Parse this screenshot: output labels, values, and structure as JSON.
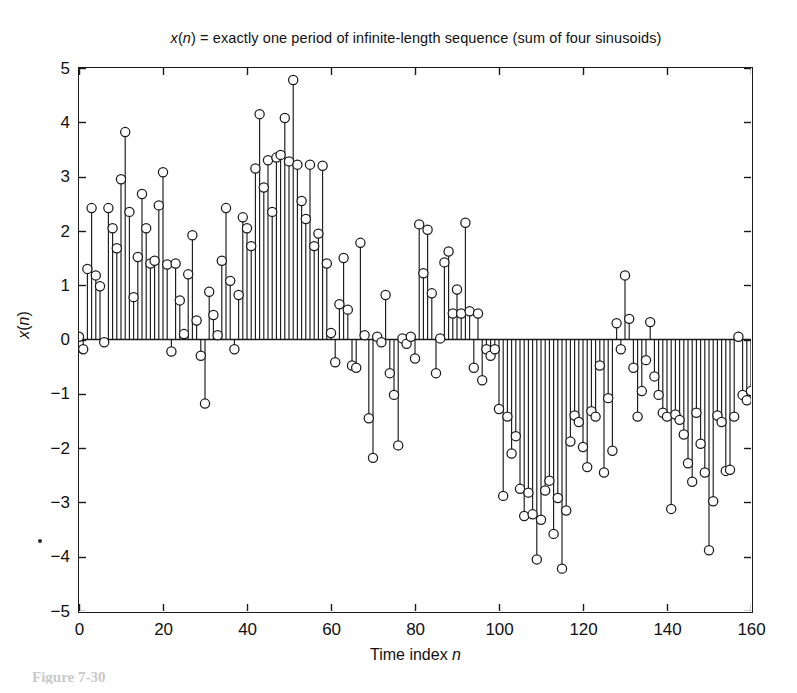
{
  "figure": {
    "title_plain": "x(n) = exactly one period of infinite-length sequence (sum of four sinusoids)",
    "title_parts": {
      "var_x": "x",
      "paren_open": "(",
      "var_n": "n",
      "paren_close": ")",
      "rest": " = exactly one period of infinite-length sequence (sum of four sinusoids)"
    },
    "caption_fragment": "Figure 7-30",
    "artifact_note": "scan-speck"
  },
  "axes": {
    "xlabel_prefix": "Time index ",
    "xlabel_var": "n",
    "ylabel_var": "x",
    "ylabel_paren_open": "(",
    "ylabel_var2": "n",
    "ylabel_paren_close": ")",
    "xticks": [
      0,
      20,
      40,
      60,
      80,
      100,
      120,
      140,
      160
    ],
    "xtick_labels": [
      "0",
      "20",
      "40",
      "60",
      "80",
      "100",
      "120",
      "140",
      "160"
    ],
    "yticks": [
      -5,
      -4,
      -3,
      -2,
      -1,
      0,
      1,
      2,
      3,
      4,
      5
    ],
    "ytick_labels": [
      "5",
      "4",
      "3",
      "2",
      "1",
      "0",
      "−1",
      "−2",
      "−3",
      "−4",
      "−5"
    ],
    "xlim": [
      0,
      160
    ],
    "ylim": [
      -5,
      5
    ],
    "grid": false,
    "box": true
  },
  "style": {
    "line_color": "#1a1a1a",
    "marker_edge_color": "#1a1a1a",
    "marker_face_color": "#ffffff",
    "axis_color": "#1a1a1a",
    "background": "#ffffff",
    "marker_radius_px": 4.6,
    "stem_line_width": 1.15,
    "marker_line_width": 1.25
  },
  "chart_data": {
    "type": "scatter",
    "plot_style": "stem",
    "title": "x(n) = exactly one period of infinite-length sequence (sum of four sinusoids)",
    "xlabel": "Time index n",
    "ylabel": "x(n)",
    "xlim": [
      0,
      160
    ],
    "ylim": [
      -5,
      5
    ],
    "grid": false,
    "legend": null,
    "series_name": "x(n)",
    "x": [
      0,
      1,
      2,
      3,
      4,
      5,
      6,
      7,
      8,
      9,
      10,
      11,
      12,
      13,
      14,
      15,
      16,
      17,
      18,
      19,
      20,
      21,
      22,
      23,
      24,
      25,
      26,
      27,
      28,
      29,
      30,
      31,
      32,
      33,
      34,
      35,
      36,
      37,
      38,
      39,
      40,
      41,
      42,
      43,
      44,
      45,
      46,
      47,
      48,
      49,
      50,
      51,
      52,
      53,
      54,
      55,
      56,
      57,
      58,
      59,
      60,
      61,
      62,
      63,
      64,
      65,
      66,
      67,
      68,
      69,
      70,
      71,
      72,
      73,
      74,
      75,
      76,
      77,
      78,
      79,
      80,
      81,
      82,
      83,
      84,
      85,
      86,
      87,
      88,
      89,
      90,
      91,
      92,
      93,
      94,
      95,
      96,
      97,
      98,
      99,
      100,
      101,
      102,
      103,
      104,
      105,
      106,
      107,
      108,
      109,
      110,
      111,
      112,
      113,
      114,
      115,
      116,
      117,
      118,
      119,
      120,
      121,
      122,
      123,
      124,
      125,
      126,
      127,
      128,
      129,
      130,
      131,
      132,
      133,
      134,
      135,
      136,
      137,
      138,
      139,
      140,
      141,
      142,
      143,
      144,
      145,
      146,
      147,
      148,
      149,
      150,
      151,
      152,
      153,
      154,
      155,
      156,
      157,
      158,
      159,
      160
    ],
    "y": [
      0.05,
      -0.18,
      1.3,
      2.42,
      1.18,
      0.98,
      -0.05,
      2.42,
      2.05,
      1.68,
      2.95,
      3.82,
      2.35,
      0.78,
      1.52,
      2.68,
      2.05,
      1.4,
      1.45,
      2.47,
      3.08,
      1.38,
      -0.22,
      1.4,
      0.72,
      0.1,
      1.2,
      1.92,
      0.35,
      -0.3,
      -1.18,
      0.88,
      0.45,
      0.08,
      1.45,
      2.42,
      1.08,
      -0.18,
      0.82,
      2.25,
      2.05,
      1.72,
      3.15,
      4.15,
      2.8,
      3.3,
      2.35,
      3.35,
      3.4,
      4.08,
      3.28,
      4.78,
      3.22,
      2.55,
      2.22,
      3.22,
      1.72,
      1.95,
      3.2,
      1.4,
      0.12,
      -0.42,
      0.65,
      1.5,
      0.55,
      -0.48,
      -0.52,
      1.78,
      0.08,
      -1.45,
      -2.18,
      0.05,
      -0.05,
      0.82,
      -0.62,
      -1.02,
      -1.95,
      0.02,
      -0.08,
      0.05,
      -0.35,
      2.12,
      1.22,
      2.02,
      0.85,
      -0.62,
      0.02,
      1.42,
      1.62,
      0.48,
      0.92,
      0.48,
      2.15,
      0.52,
      -0.52,
      0.48,
      -0.75,
      -0.18,
      -0.3,
      -0.18,
      -1.28,
      -2.88,
      -1.42,
      -2.1,
      -1.78,
      -2.75,
      -3.25,
      -2.82,
      -3.22,
      -4.05,
      -3.32,
      -2.78,
      -2.6,
      -3.58,
      -2.92,
      -4.22,
      -3.15,
      -1.88,
      -1.4,
      -1.52,
      -1.98,
      -2.35,
      -1.32,
      -1.42,
      -0.48,
      -2.45,
      -1.08,
      -2.05,
      0.3,
      -0.18,
      1.18,
      0.38,
      -0.52,
      -1.42,
      -0.95,
      -0.38,
      0.32,
      -0.68,
      -1.02,
      -1.35,
      -1.42,
      -3.12,
      -1.38,
      -1.48,
      -1.75,
      -2.28,
      -2.62,
      -1.35,
      -1.92,
      -2.45,
      -3.88,
      -2.98,
      -1.4,
      -1.52,
      -2.42,
      -2.4,
      -1.42,
      0.05,
      -1.02,
      -1.12,
      -0.95,
      -1.35,
      0.22
    ]
  }
}
